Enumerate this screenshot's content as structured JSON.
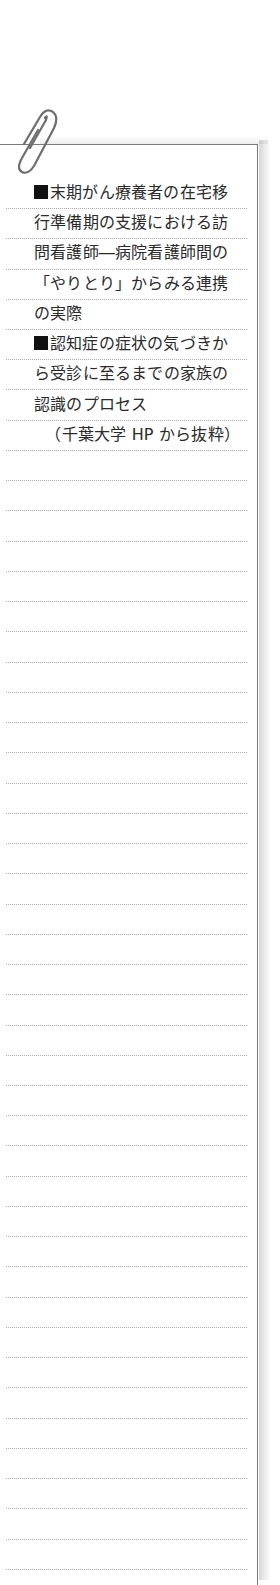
{
  "note": {
    "entries": [
      {
        "bullet": "■",
        "lines": [
          "末期がん療養者の在宅移",
          "行準備期の支援における訪",
          "問看護師―病院看護師間の",
          "「やりとり」からみる連携",
          "の実際"
        ]
      },
      {
        "bullet": "■",
        "lines": [
          "認知症の症状の気づきか",
          "ら受診に至るまでの家族の",
          "認識のプロセス"
        ]
      }
    ],
    "citation": "（千葉大学 HP から抜粋）"
  },
  "decor": {
    "paperclip_icon": "paperclip-icon",
    "ruled_line_count": 46,
    "ruled_line_spacing_px": 30.24,
    "first_ruled_line_y": 207,
    "border_color": "#7a7a7a",
    "rule_color": "#a8a8a8",
    "text_color": "#2b2b2b"
  }
}
